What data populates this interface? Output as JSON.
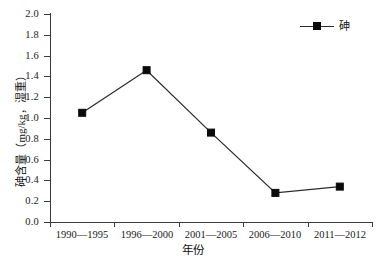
{
  "chart_data": {
    "type": "line",
    "title": "",
    "xlabel": "年份",
    "ylabel": "砷含量（mg/kg，湿重）",
    "categories": [
      "1990—1995",
      "1996—2000",
      "2001—2005",
      "2006—2010",
      "2011—2012"
    ],
    "series": [
      {
        "name": "砷",
        "values": [
          1.05,
          1.46,
          0.86,
          0.28,
          0.34
        ],
        "color": "#0a0a0a",
        "marker": "filled-square"
      }
    ],
    "ylim": [
      0.0,
      2.0
    ],
    "ytick_step": 0.2,
    "ytick_labels": [
      "0.0",
      "0.2",
      "0.4",
      "0.6",
      "0.8",
      "1.0",
      "1.2",
      "1.4",
      "1.6",
      "1.8",
      "2.0"
    ],
    "grid": false,
    "legend_position": "top-right",
    "axis_color": "#3a3a3a"
  },
  "legend": {
    "entries": [
      {
        "label": "砷"
      }
    ]
  },
  "axes": {
    "x_title": "年份",
    "y_title": "砷含量（mg/kg，湿重）"
  }
}
